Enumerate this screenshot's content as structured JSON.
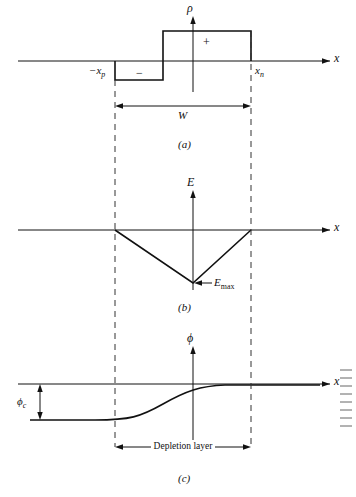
{
  "figure": {
    "title_implicit": "Charge density, electric field and potential across a pn junction depletion layer",
    "panels": [
      {
        "id": "a",
        "letter": "(a)",
        "vertical_axis_label": "ρ",
        "horizontal_axis_label": "x",
        "annotations": [
          {
            "name": "minus-region-sign",
            "text": "−"
          },
          {
            "name": "plus-region-sign",
            "text": "+"
          },
          {
            "name": "left-depletion-edge",
            "text": "−x",
            "sub": "p"
          },
          {
            "name": "right-depletion-edge",
            "text": "x",
            "sub": "n"
          },
          {
            "name": "width-label",
            "text": "W"
          }
        ]
      },
      {
        "id": "b",
        "letter": "(b)",
        "vertical_axis_label": "E",
        "horizontal_axis_label": "x",
        "annotations": [
          {
            "name": "emax-label",
            "text": "E",
            "sub": "max"
          }
        ]
      },
      {
        "id": "c",
        "letter": "(c)",
        "vertical_axis_label": "ϕ",
        "horizontal_axis_label": "x",
        "annotations": [
          {
            "name": "contact-potential-label",
            "text": "ϕ",
            "sub": "c"
          },
          {
            "name": "depletion-layer-label",
            "text": "Depletion layer"
          }
        ]
      }
    ],
    "colors": {
      "line": "#111111",
      "dashed": "#333333",
      "background": "#ffffff"
    }
  }
}
